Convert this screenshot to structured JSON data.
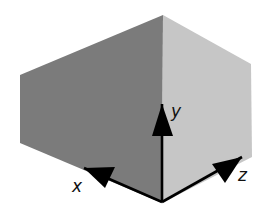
{
  "diagram": {
    "colors": {
      "background": "#ffffff",
      "left_face": "#7b7b7b",
      "right_face": "#c6c6c6",
      "axis": "#000000",
      "label": "#111111"
    },
    "faces": {
      "left": {
        "name": "left-face",
        "points": "163,15 20,75 20,143 162,203"
      },
      "right": {
        "name": "right-face",
        "points": "163,15 251,64 252,157 162,203"
      }
    },
    "origin": {
      "x": 162,
      "y": 202
    },
    "axes": [
      {
        "id": "x",
        "label": "x",
        "tip": {
          "x": 84,
          "y": 168
        },
        "head": "84,168 115,167 105,188",
        "label_pos": {
          "x": 72,
          "y": 192
        }
      },
      {
        "id": "y",
        "label": "y",
        "tip": {
          "x": 162,
          "y": 104
        },
        "head": "162,104 152,136 173,136",
        "label_pos": {
          "x": 171,
          "y": 117
        }
      },
      {
        "id": "z",
        "label": "z",
        "tip": {
          "x": 242,
          "y": 157
        },
        "head": "242,157 212,164 225,183",
        "label_pos": {
          "x": 238,
          "y": 181
        }
      }
    ]
  }
}
